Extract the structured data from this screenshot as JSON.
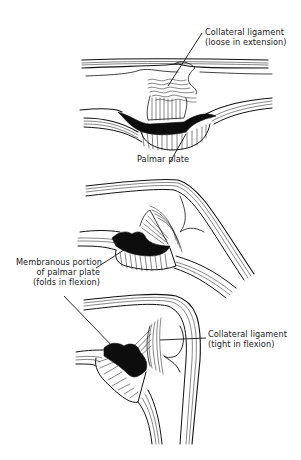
{
  "figure": {
    "panels": [
      {
        "id": "extension",
        "labels": [
          {
            "lines": [
              "Collateral ligament",
              "(loose in extension)"
            ]
          },
          {
            "lines": [
              "Palmar plate"
            ]
          }
        ]
      },
      {
        "id": "mid-flexion",
        "labels": [
          {
            "lines": [
              "Membranous portion",
              "of palmar plate",
              "(folds in flexion)"
            ]
          }
        ]
      },
      {
        "id": "full-flexion",
        "labels": [
          {
            "lines": [
              "Collateral ligament",
              "(tight in flexion)"
            ]
          }
        ]
      }
    ]
  },
  "colors": {
    "ink": "#111111",
    "background": "#ffffff"
  }
}
